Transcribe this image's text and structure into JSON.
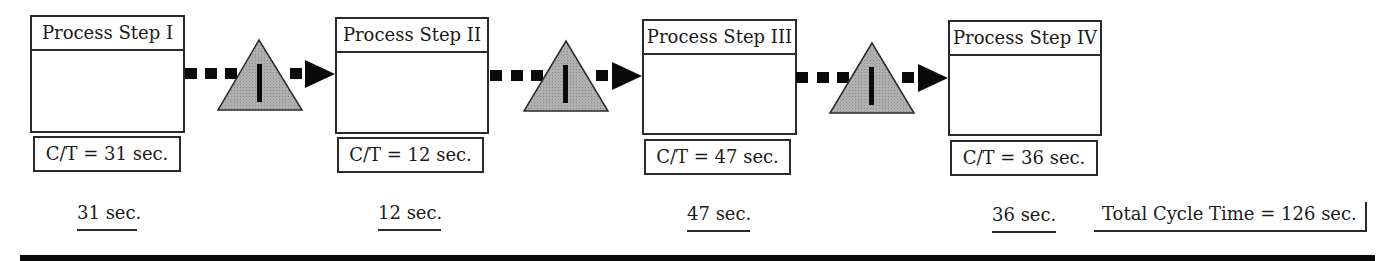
{
  "diagram": {
    "type": "value-stream-map-timeline",
    "process_steps": [
      {
        "title": "Process Step I",
        "cycle_time_label": "C/T = 31 sec.",
        "timeline_value": "31 sec."
      },
      {
        "title": "Process Step II",
        "cycle_time_label": "C/T = 12 sec.",
        "timeline_value": "12 sec."
      },
      {
        "title": "Process Step III",
        "cycle_time_label": "C/T = 47 sec.",
        "timeline_value": "47 sec."
      },
      {
        "title": "Process Step IV",
        "cycle_time_label": "C/T = 36 sec.",
        "timeline_value": "36 sec."
      }
    ],
    "inventory_markers": [
      {
        "symbol": "inventory-triangle",
        "label": "I"
      },
      {
        "symbol": "inventory-triangle",
        "label": "I"
      },
      {
        "symbol": "inventory-triangle",
        "label": "I"
      }
    ],
    "total": {
      "label": "Total Cycle Time = 126 sec."
    },
    "colors": {
      "stroke": "#2a2a2a",
      "triangle_fill": "#a8a8a8",
      "arrow": "#0a0a0a"
    }
  }
}
